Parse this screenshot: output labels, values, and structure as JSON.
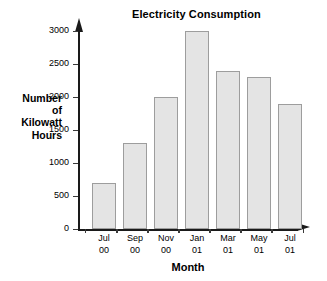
{
  "chart_data": {
    "type": "bar",
    "title": "Electricity Consumption",
    "xlabel": "Month",
    "ylabel": "Number of Kilowatt Hours",
    "ylabel_lines": [
      "Number",
      "of",
      "Kilowatt",
      "Hours"
    ],
    "categories": [
      "Jul 00",
      "Sep 00",
      "Nov 00",
      "Jan 01",
      "Mar 01",
      "May 01",
      "Jul 01"
    ],
    "category_lines": [
      [
        "Jul",
        "00"
      ],
      [
        "Sep",
        "00"
      ],
      [
        "Nov",
        "00"
      ],
      [
        "Jan",
        "01"
      ],
      [
        "Mar",
        "01"
      ],
      [
        "May",
        "01"
      ],
      [
        "Jul",
        "01"
      ]
    ],
    "values": [
      700,
      1300,
      2000,
      3000,
      2400,
      2300,
      1900
    ],
    "ylim": [
      0,
      3000
    ],
    "yticks": [
      0,
      500,
      1000,
      1500,
      2000,
      2500,
      3000
    ],
    "ytick_labels": [
      "0",
      "500",
      "1000",
      "1500",
      "2000",
      "2500",
      "3000"
    ],
    "grid": false,
    "legend": false,
    "bar_fill_color": "#e4e4e4",
    "bar_border_color": "#9d9d9d",
    "axis_color": "#1a1a1a",
    "background_color": "#ffffff"
  }
}
